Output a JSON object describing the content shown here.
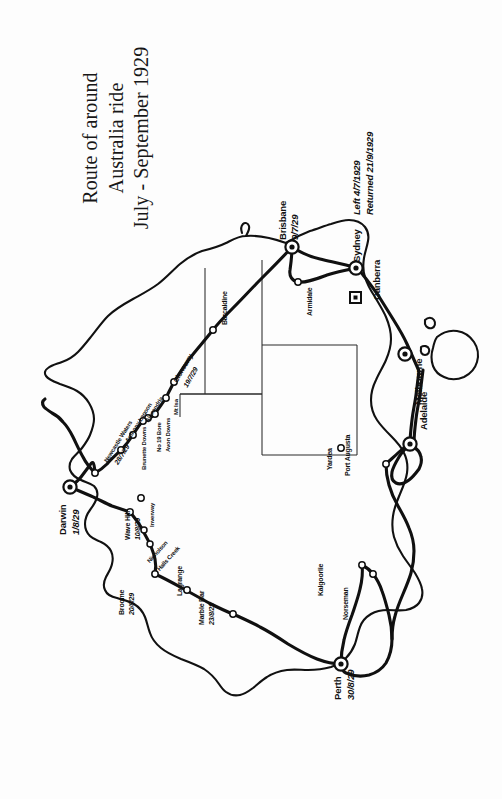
{
  "document": {
    "type": "scanned-map",
    "background_color": "#fdfdfd",
    "ink_color": "#101010"
  },
  "title": {
    "line1": "Route of around",
    "line2": "Australia ride",
    "line3": "July - September 1929"
  },
  "map": {
    "name": "australia-route-map",
    "orientation": "rotated-90-ccw",
    "major_cities": [
      {
        "name": "Brisbane",
        "date": "9/7/29",
        "marker": "double-circle"
      },
      {
        "name": "Sydney",
        "date": "Left 4/7/1929",
        "date2": "Returned 21/9/1929",
        "marker": "double-circle"
      },
      {
        "name": "Canberra",
        "date": "",
        "marker": "square"
      },
      {
        "name": "Melbourne",
        "date": "",
        "marker": "double-circle"
      },
      {
        "name": "Adelaide",
        "date": "",
        "marker": "double-circle"
      },
      {
        "name": "Perth",
        "date": "30/8/29",
        "marker": "double-circle"
      },
      {
        "name": "Darwin",
        "date": "1/8/29",
        "marker": "double-circle"
      }
    ],
    "waypoints": [
      {
        "name": "Armidale"
      },
      {
        "name": "Barcaldine"
      },
      {
        "name": "Cloncurry",
        "date": "19/7/29"
      },
      {
        "name": "Mt Isa"
      },
      {
        "name": "Avon Downs"
      },
      {
        "name": "No 19 Bore"
      },
      {
        "name": "Alexandria"
      },
      {
        "name": "Brunette Downs"
      },
      {
        "name": "Anthony Lagoon"
      },
      {
        "name": "Newcastle Waters",
        "date": "28/7/29"
      },
      {
        "name": "Inverway"
      },
      {
        "name": "Wave Hill",
        "date": "10/8/29"
      },
      {
        "name": "Nicholson"
      },
      {
        "name": "Halls Creek"
      },
      {
        "name": "Broome",
        "date": "20/8/29"
      },
      {
        "name": "Lagrange"
      },
      {
        "name": "Marble Bar",
        "date": "23/8/29"
      },
      {
        "name": "Kalgoorlie"
      },
      {
        "name": "Norseman"
      },
      {
        "name": "Yardea"
      },
      {
        "name": "Port Augusta"
      }
    ],
    "labels": {
      "brisbane": "Brisbane",
      "brisbane_date": "9/7/29",
      "sydney": "Sydney",
      "sydney_left": "Left 4/7/1929",
      "sydney_returned": "Returned 21/9/1929",
      "canberra": "Canberra",
      "melbourne": "Melbourne",
      "adelaide": "Adelaide",
      "perth": "Perth",
      "perth_date": "30/8/29",
      "darwin": "Darwin",
      "darwin_date": "1/8/29",
      "armidale": "Armidale",
      "barcaldine": "Barcaldine",
      "cloncurry": "Cloncurry",
      "cloncurry_date": "19/7/29",
      "mt_isa": "Mt Isa",
      "avon_downs": "Avon Downs",
      "no19_bore": "No 19 Bore",
      "alexandria": "Alexandria",
      "brunette_downs": "Brunette Downs",
      "anthony_lagoon": "Anthony Lagoon",
      "newcastle_waters": "Newcastle Waters",
      "newcastle_waters_date": "28/7/29",
      "inverway": "Inverway",
      "wave_hill": "Wave Hill",
      "wave_hill_date": "10/8/29",
      "nicholson": "Nicholson",
      "halls_creek": "Halls Creek",
      "broome": "Broome",
      "broome_date": "20/8/29",
      "lagrange": "Lagrange",
      "marble_bar": "Marble Bar",
      "marble_bar_date": "23/8/29",
      "kalgoorlie": "Kalgoorlie",
      "norseman": "Norseman",
      "yardea": "Yardea",
      "port_augusta": "Port Augusta"
    }
  }
}
